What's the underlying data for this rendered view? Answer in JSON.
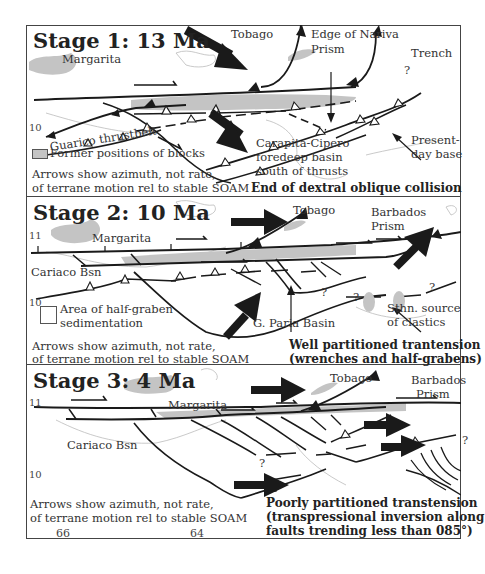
{
  "figure": {
    "type": "tectonic-evolution-diagram",
    "panels": [
      {
        "title": "Stage 1: 13 Ma",
        "labels": {
          "margarita": "Margarita",
          "tobago": "Tobago",
          "edge_nariva": "Edge of Nariva\nPrism",
          "edge_nariva_line1": "Edge of Nariva",
          "edge_nariva_line2": "Prism",
          "trench": "Trench",
          "guarico": "Guarico thrustbelt",
          "lat10": "10",
          "carapita_line1": "Carapita-Cipero",
          "carapita_line2": "foredeep basin",
          "carapita_line3": "south of thrusts",
          "present_line1": "Present-",
          "present_line2": "day base",
          "question": "?"
        },
        "legend": {
          "label": "Former positions of blocks",
          "color": "#c4c4c4"
        },
        "note_line1": "Arrows show azimuth, not rate,",
        "note_line2": "of terrane motion rel to stable SOAM",
        "caption": "End of dextral oblique collision"
      },
      {
        "title": "Stage 2: 10 Ma",
        "labels": {
          "lat11": "11",
          "lat10": "10",
          "margarita": "Margarita",
          "tobago": "Tobago",
          "barbados_line1": "Barbados",
          "barbados_line2": "Prism",
          "cariaco": "Cariaco Bsn",
          "paria": "G. Paria Basin",
          "sthn_line1": "Sthn. source",
          "sthn_line2": "of clastics",
          "question": "?"
        },
        "legend": {
          "label_line1": "Area of half-graben",
          "label_line2": "sedimentation",
          "color": "#ffffff"
        },
        "note_line1": "Arrows show azimuth, not rate,",
        "note_line2": "of terrane motion rel to stable SOAM",
        "caption_line1": "Well partitioned trantension",
        "caption_line2": "(wrenches and half-grabens)"
      },
      {
        "title": "Stage 3: 4 Ma",
        "labels": {
          "lat11": "11",
          "lat10": "10",
          "margarita": "Margarita",
          "tobago": "Tobago",
          "barbados_line1": "Barbados",
          "barbados_line2": "Prism",
          "cariaco": "Cariaco Bsn",
          "question": "?"
        },
        "note_line1": "Arrows show azimuth, not rate,",
        "note_line2": "of terrane motion rel to stable SOAM",
        "caption_line1": "Poorly partitioned transtension",
        "caption_line2": "(transpressional inversion along",
        "caption_line3": "faults trending less than 085°)",
        "lon_labels": [
          "66",
          "64"
        ]
      }
    ],
    "colors": {
      "line": "#1a1a1a",
      "block": "#c4c4c4",
      "coast": "#bdbdbd",
      "border": "#444444"
    }
  }
}
